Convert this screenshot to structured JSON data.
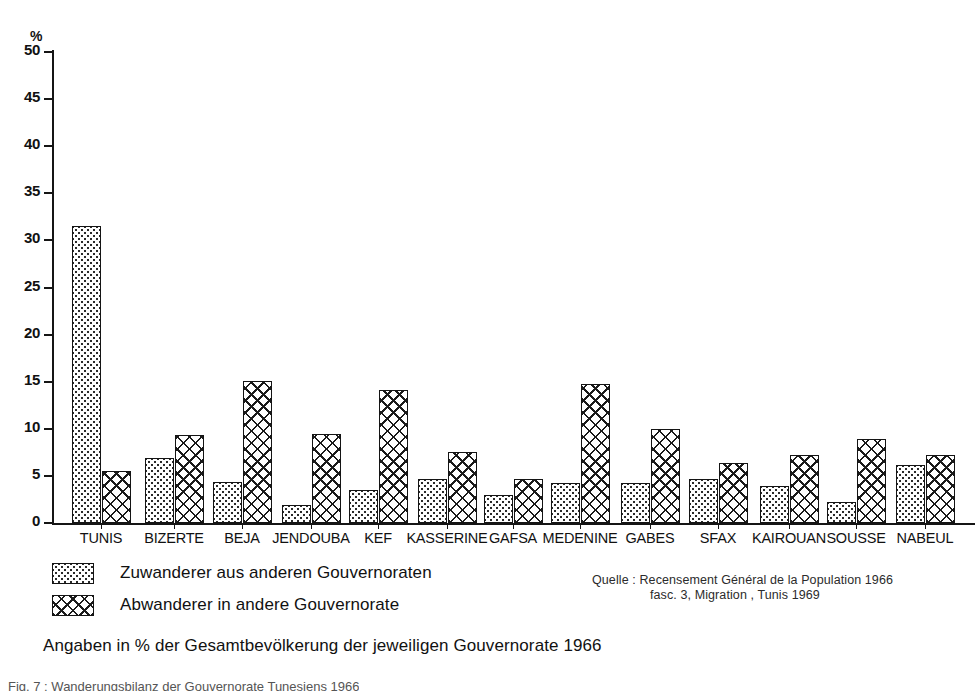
{
  "axis": {
    "unit_label": "%",
    "yticks": [
      0,
      5,
      10,
      15,
      20,
      25,
      30,
      35,
      40,
      45,
      50
    ]
  },
  "legend": {
    "immigrants_label": "Zuwanderer aus anderen Gouvernoraten",
    "emigrants_label": "Abwanderer in andere Gouvernorate",
    "immigrants_swatch": "stippled-swatch",
    "emigrants_swatch": "crosshatch-swatch"
  },
  "note": "Angaben in % der Gesamtbevölkerung der jeweiligen Gouvernorate 1966",
  "source": {
    "line1": "Quelle :  Recensement Général de la Population 1966",
    "line2": "fasc. 3, Migration , Tunis 1969"
  },
  "figure_caption": "Fig.  7 :  Wanderungsbilanz  der  Gouvernorate  Tunesiens  1966",
  "chart_data": {
    "type": "bar",
    "title": "",
    "xlabel": "",
    "ylabel": "%",
    "ylim": [
      0,
      50
    ],
    "ytick_step": 5,
    "grid": false,
    "legend_position": "bottom-left",
    "categories": [
      "TUNIS",
      "BIZERTE",
      "BEJA",
      "JENDOUBA",
      "KEF",
      "KASSERINE",
      "GAFSA",
      "MEDENINE",
      "GABES",
      "SFAX",
      "KAIROUAN",
      "SOUSSE",
      "NABEUL"
    ],
    "series": [
      {
        "name": "Zuwanderer aus anderen Gouvernoraten",
        "pattern": "stippled",
        "values": [
          31.5,
          6.9,
          4.4,
          1.9,
          3.5,
          4.7,
          3.0,
          4.3,
          4.3,
          4.7,
          3.9,
          2.2,
          6.2
        ]
      },
      {
        "name": "Abwanderer in andere Gouvernorate",
        "pattern": "crosshatch",
        "values": [
          5.5,
          9.3,
          15.1,
          9.4,
          14.1,
          7.5,
          4.7,
          14.8,
          10.0,
          6.4,
          7.2,
          8.9,
          7.2
        ]
      }
    ]
  }
}
